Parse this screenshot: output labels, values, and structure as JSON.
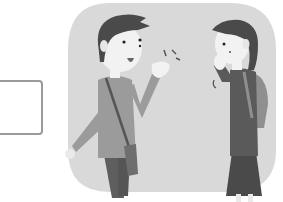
{
  "scene": {
    "description": "Two people greeting each other",
    "answer_box": {
      "value": ""
    },
    "colors": {
      "background_blob": "#d9d9d9",
      "hair": "#4a4a4a",
      "skin": "#f2f2f2",
      "boy_shirt": "#9b9b9b",
      "boy_pants": "#5e5e5e",
      "bag": "#6e6e6e",
      "girl_shirt": "#5a5a5a",
      "girl_skirt": "#4a4a4a",
      "backpack": "#8f8f8f",
      "box_border": "#9a9a9a"
    }
  }
}
